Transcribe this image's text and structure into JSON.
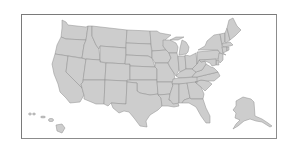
{
  "map": {
    "title": "United States map",
    "region": "USA",
    "style": {
      "fill": "#cdcdcd",
      "border": "#8f8f8f",
      "frame": "#7a7a7a",
      "background": "#ffffff"
    },
    "insets": [
      "Alaska",
      "Hawaii"
    ],
    "states_shown": [
      "WA",
      "OR",
      "CA",
      "NV",
      "ID",
      "MT",
      "WY",
      "UT",
      "AZ",
      "NM",
      "CO",
      "ND",
      "SD",
      "NE",
      "KS",
      "OK",
      "TX",
      "MN",
      "IA",
      "MO",
      "AR",
      "LA",
      "WI",
      "IL",
      "MI",
      "IN",
      "OH",
      "KY",
      "TN",
      "MS",
      "AL",
      "GA",
      "FL",
      "SC",
      "NC",
      "VA",
      "WV",
      "PA",
      "NY",
      "VT",
      "NH",
      "ME",
      "MA",
      "CT",
      "RI",
      "NJ",
      "DE",
      "MD",
      "AK",
      "HI"
    ]
  }
}
